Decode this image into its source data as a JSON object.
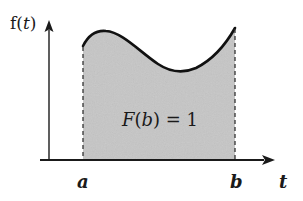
{
  "diagram": {
    "y_axis_label": "f(t)",
    "y_axis_label_func": "f",
    "y_axis_label_var": "t",
    "x_axis_label": "t",
    "lower_bound_label": "a",
    "upper_bound_label": "b",
    "area_annotation": "F(b) = 1",
    "area_annotation_parts": {
      "func": "F",
      "open": "(",
      "arg": "b",
      "close": ")",
      "rest": " = 1"
    },
    "colors": {
      "fill": "#c6c6c6",
      "curve": "#111111",
      "axes": "#1a1a1a",
      "dashed_lines": "#333333",
      "background": "#ffffff"
    }
  }
}
